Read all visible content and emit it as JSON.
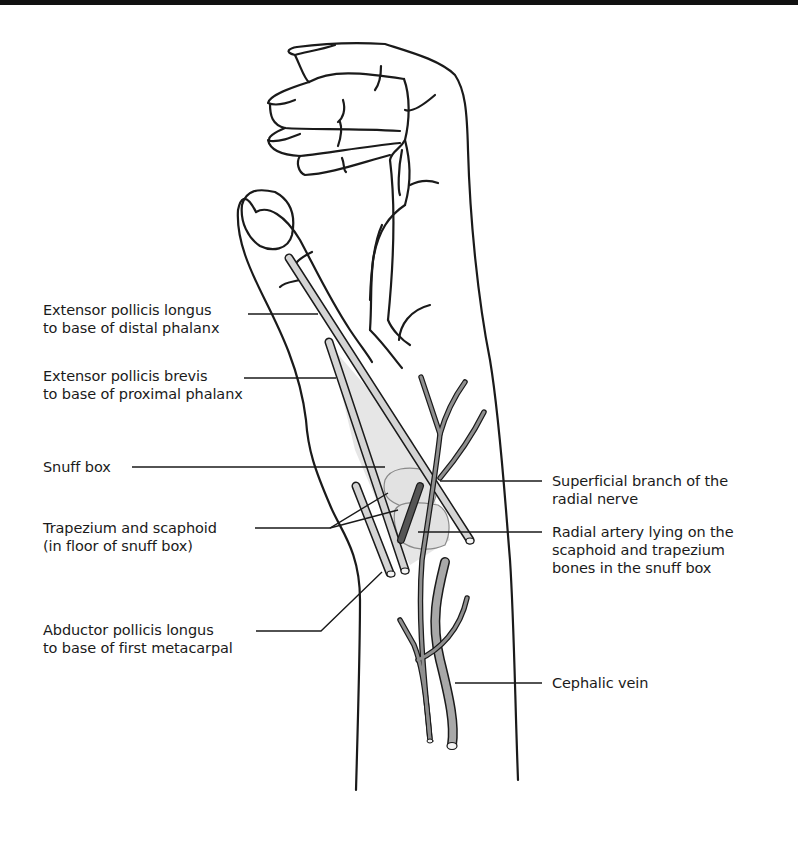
{
  "figure": {
    "type": "anatomical-diagram",
    "colors": {
      "outline": "#1a1a1a",
      "tendon_fill": "#d4d4d4",
      "snuffbox_fill": "#e6e6e6",
      "bone_outline": "#8a8a8a",
      "nerve_fill": "#8f8f8f",
      "vein_fill": "#a8a8a8",
      "artery_fill": "#555555"
    }
  },
  "labels": {
    "left": [
      {
        "id": "epl",
        "line1": "Extensor pollicis longus",
        "line2": "to base of distal phalanx"
      },
      {
        "id": "epb",
        "line1": "Extensor pollicis brevis",
        "line2": "to base of proximal phalanx"
      },
      {
        "id": "snuffbox",
        "line1": "Snuff box",
        "line2": ""
      },
      {
        "id": "bones",
        "line1": "Trapezium and scaphoid",
        "line2": "(in floor of snuff box)"
      },
      {
        "id": "apl",
        "line1": "Abductor pollicis longus",
        "line2": "to base of first metacarpal"
      }
    ],
    "right": [
      {
        "id": "nerve",
        "line1": "Superficial branch of the",
        "line2": "radial nerve",
        "line3": ""
      },
      {
        "id": "artery",
        "line1": "Radial artery lying on the",
        "line2": "scaphoid and trapezium",
        "line3": "bones in the snuff box"
      },
      {
        "id": "vein",
        "line1": "Cephalic vein",
        "line2": "",
        "line3": ""
      }
    ]
  }
}
